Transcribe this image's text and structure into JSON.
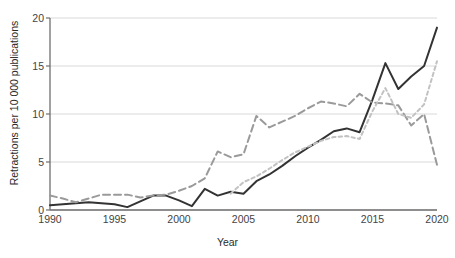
{
  "figure": {
    "top_cut_text": "",
    "axis_color": "#6f6f6f",
    "grid_color": "#d9d9d9",
    "background": "#ffffff"
  },
  "chart_data": {
    "type": "line",
    "title": "",
    "xlabel": "Year",
    "ylabel": "Retractions per 10 000 publications",
    "xlim": [
      1990,
      2020
    ],
    "ylim": [
      0,
      20
    ],
    "xticks": [
      1990,
      1995,
      2000,
      2005,
      2010,
      2015,
      2020
    ],
    "yticks": [
      0,
      5,
      10,
      15,
      20
    ],
    "grid": "horizontal",
    "legend_position": "none",
    "x": [
      1990,
      1991,
      1992,
      1993,
      1994,
      1995,
      1996,
      1997,
      1998,
      1999,
      2000,
      2001,
      2002,
      2003,
      2004,
      2005,
      2006,
      2007,
      2008,
      2009,
      2010,
      2011,
      2012,
      2013,
      2014,
      2015,
      2016,
      2017,
      2018,
      2019,
      2020
    ],
    "series": [
      {
        "name": "solid-black-series",
        "style": "solid",
        "color": "#333333",
        "width": 2.0,
        "values": [
          0.5,
          0.6,
          0.7,
          0.8,
          0.7,
          0.6,
          0.3,
          0.9,
          1.5,
          1.5,
          1.0,
          0.4,
          2.2,
          1.5,
          1.9,
          1.7,
          3.0,
          3.7,
          4.6,
          5.6,
          6.5,
          7.3,
          8.2,
          8.5,
          8.1,
          11.5,
          15.3,
          12.6,
          13.9,
          15.0,
          19.0
        ]
      },
      {
        "name": "gray-long-dash-series",
        "style": "long-dash",
        "color": "#9a9a9a",
        "width": 2.0,
        "values": [
          1.5,
          1.2,
          0.8,
          1.2,
          1.6,
          1.6,
          1.6,
          1.3,
          1.5,
          1.6,
          2.0,
          2.5,
          3.3,
          6.1,
          5.5,
          5.8,
          9.8,
          8.6,
          9.2,
          9.8,
          10.6,
          11.3,
          11.1,
          10.8,
          12.1,
          11.2,
          11.1,
          10.9,
          8.8,
          10.0,
          4.7
        ]
      },
      {
        "name": "light-gray-short-dash-series",
        "style": "short-dash",
        "color": "#c2c2c2",
        "width": 2.0,
        "values": [
          null,
          null,
          null,
          null,
          null,
          null,
          null,
          null,
          null,
          null,
          null,
          null,
          null,
          null,
          1.7,
          2.9,
          3.5,
          4.3,
          5.2,
          6.0,
          6.6,
          7.2,
          7.6,
          7.7,
          7.4,
          10.3,
          12.7,
          10.0,
          9.6,
          11.0,
          15.5
        ]
      }
    ]
  }
}
